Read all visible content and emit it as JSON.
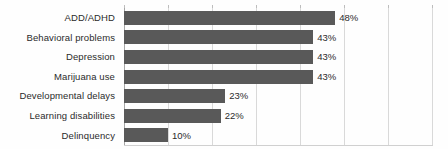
{
  "chart_data": {
    "type": "bar",
    "orientation": "horizontal",
    "title": "",
    "subtitle": "",
    "xlabel": "",
    "ylabel": "",
    "xlim": [
      0,
      70
    ],
    "grid": "vertical",
    "legend": "none",
    "value_suffix": "%",
    "categories": [
      "ADD/ADHD",
      "Behavioral problems",
      "Depression",
      "Marijuana use",
      "Developmental delays",
      "Learning disabilities",
      "Delinquency"
    ],
    "values": [
      48,
      43,
      43,
      43,
      23,
      22,
      10
    ],
    "data_labels": [
      "48%",
      "43%",
      "43%",
      "43%",
      "23%",
      "22%",
      "10%"
    ],
    "gridline_values": [
      0,
      10,
      20,
      30,
      40,
      50,
      60,
      70
    ],
    "bar_color": "#595959",
    "gridline_color": "#d9d9d9",
    "axis_color": "#a6a6a6",
    "label_color": "#2b2b2b",
    "background_color": "#fefefe"
  }
}
